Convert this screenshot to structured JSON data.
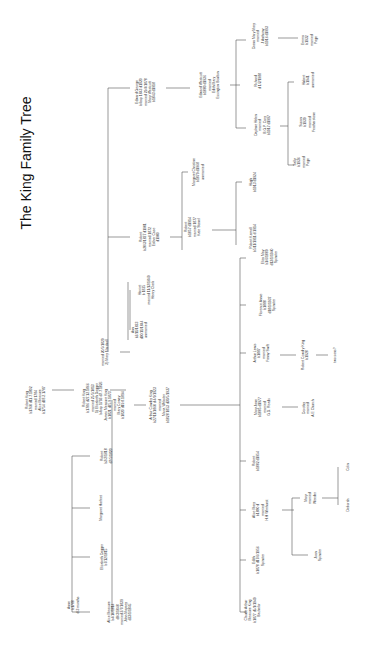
{
  "title": "The King Family Tree",
  "colors": {
    "background": "#ffffff",
    "line": "#555555",
    "text": "#333333"
  },
  "people": [
    {
      "id": "robert-king-sr",
      "x": 36,
      "y": 400,
      "lines": [
        "Robert King",
        "b1760 d11.7.1802",
        "married 1784",
        "Alice Measure",
        "b1754 d28.2.1787"
      ]
    },
    {
      "id": "robert-king",
      "x": 93,
      "y": 398,
      "lines": [
        "Robert King",
        "b1786 d27.12.1866",
        "married 25/5/1813",
        "1) Elizabeth Dagger",
        "b/bap 1793 d7.7.1826"
      ]
    },
    {
      "id": "robert-king-marriage2",
      "x": 105,
      "y": 352,
      "lines": [
        "married 20/5/1829",
        "2) Mary Marshall"
      ]
    },
    {
      "id": "anne",
      "x": 73,
      "y": 605,
      "lines": [
        "Anne",
        "b1788",
        "d 3 months"
      ]
    },
    {
      "id": "alice-measure",
      "x": 120,
      "y": 612,
      "lines": [
        "Alice Measure",
        "b4/10/1814",
        "d9/3/1848",
        "married 2/7/1839",
        "John Maysey",
        "d23/1/1845"
      ]
    },
    {
      "id": "elizabeth-dagger",
      "x": 104,
      "y": 557,
      "lines": [
        "Elizabeth Dagger",
        "b7/12/1815"
      ]
    },
    {
      "id": "margaret-harfeet",
      "x": 101,
      "y": 508,
      "lines": [
        "Margaret Harfeet"
      ]
    },
    {
      "id": "robert-b1818",
      "x": 106,
      "y": 456,
      "lines": [
        "Robert",
        "b2/2/1818",
        "d7/5/1820"
      ]
    },
    {
      "id": "james-measure-king",
      "x": 115,
      "y": 405,
      "lines": [
        "James Measure King",
        "b1821 d25.9.1873",
        "married",
        "Mary Cowey",
        "b1820 d19.8.1894"
      ]
    },
    {
      "id": "ann",
      "x": 140,
      "y": 330,
      "lines": [
        "Ann",
        "b2/11/1823",
        "d30/11/1844",
        "unmarried"
      ]
    },
    {
      "id": "harriet",
      "x": 147,
      "y": 290,
      "lines": [
        "Harriet",
        "b 1825",
        "married 11/12/1849",
        "Henry Clark"
      ]
    },
    {
      "id": "robert-b1827",
      "x": 150,
      "y": 237,
      "lines": [
        "Robert",
        "b20/3/1827 d1901",
        "married 1872",
        "Esther Case",
        "d1900"
      ]
    },
    {
      "id": "edward-george",
      "x": 146,
      "y": 92,
      "lines": [
        "Edward George",
        "b/bap 1843 d1920",
        "married 29/4/1878",
        "Mary Westcott",
        "b1843 d1918"
      ]
    },
    {
      "id": "arthur-cowdry-king",
      "x": 160,
      "y": 405,
      "lines": [
        "Arthur Cowdry King",
        "b27/11/1860 d 4/9/1923",
        "married",
        "Maria Webster",
        "b1828 1853 d30/5/1937"
      ]
    },
    {
      "id": "robert-b1857",
      "x": 193,
      "y": 227,
      "lines": [
        "Robert",
        "b1857 d1914",
        "married 1877",
        "Kate Stanel"
      ]
    },
    {
      "id": "margaret-christine",
      "x": 198,
      "y": 172,
      "lines": [
        "Margaret Christine",
        "b1879 d1968",
        "unmarried"
      ]
    },
    {
      "id": "edward-westcott",
      "x": 210,
      "y": 85,
      "lines": [
        "Edward Westcott",
        "b1880 d1936",
        "married",
        "Edith Mary",
        "Essington Boulton"
      ]
    },
    {
      "id": "robert-kemall",
      "x": 253,
      "y": 238,
      "lines": [
        "Robert Kemall",
        "b5/11/1911 d 1914"
      ]
    },
    {
      "id": "hugh",
      "x": 253,
      "y": 182,
      "lines": [
        "Hugh",
        "b1913 d1924"
      ]
    },
    {
      "id": "daphne-helen",
      "x": 263,
      "y": 125,
      "lines": [
        "Daphne Helen",
        "married",
        "B.G.P. Cary",
        "b1917 d1997"
      ]
    },
    {
      "id": "richard",
      "x": 258,
      "y": 81,
      "lines": [
        "Richard",
        "d 1/2/1988"
      ]
    },
    {
      "id": "diana-mary",
      "x": 261,
      "y": 36,
      "lines": [
        "Diana Mary Mary",
        "married",
        "J Anthony",
        "b1916 d1993"
      ]
    },
    {
      "id": "sally",
      "x": 302,
      "y": 162,
      "lines": [
        "Sally",
        "b1936",
        "married",
        "Page"
      ]
    },
    {
      "id": "susan",
      "x": 308,
      "y": 122,
      "lines": [
        "Susan",
        "b1939",
        "married",
        "Featherstone"
      ]
    },
    {
      "id": "hubert",
      "x": 308,
      "y": 80,
      "lines": [
        "Hubert",
        "b1941",
        "unmarried"
      ]
    },
    {
      "id": "emma",
      "x": 310,
      "y": 40,
      "lines": [
        "Emma",
        "b1932",
        "married",
        "Page"
      ]
    },
    {
      "id": "claude-arthur",
      "x": 253,
      "y": 610,
      "lines": [
        "Claude Arthur",
        "Measure King",
        "b1877 d5/1/1949",
        "Bachelor"
      ]
    },
    {
      "id": "edith",
      "x": 258,
      "y": 560,
      "lines": [
        "Edith",
        "b1878 d17/6/1956",
        "Spinster"
      ]
    },
    {
      "id": "alice-mary",
      "x": 261,
      "y": 510,
      "lines": [
        "Alice Mary",
        "b1880 d",
        "married",
        "H.H Wimhurst"
      ]
    },
    {
      "id": "robert-b1882",
      "x": 256,
      "y": 461,
      "lines": [
        "Robert",
        "b1882 d1954"
      ]
    },
    {
      "id": "mary-jane",
      "x": 263,
      "y": 407,
      "lines": [
        "Mary Jane",
        "b1885 d1977",
        "married",
        "G.D. Reads"
      ]
    },
    {
      "id": "arthur-lewis",
      "x": 262,
      "y": 353,
      "lines": [
        "Arthur Lewis",
        "b1887",
        "married",
        "Fanny Swift"
      ]
    },
    {
      "id": "florence-annie",
      "x": 268,
      "y": 305,
      "lines": [
        "Florence Annie",
        "b1888",
        "d18/1/1937",
        "Spinster"
      ]
    },
    {
      "id": "eliza-may",
      "x": 270,
      "y": 257,
      "lines": [
        "Eliza May",
        "b1/6/1889",
        "d13/1/1940",
        "Spinster"
      ]
    },
    {
      "id": "joan-spinster",
      "x": 318,
      "y": 555,
      "lines": [
        "Joan",
        "Spinster"
      ]
    },
    {
      "id": "mary-weeder",
      "x": 310,
      "y": 498,
      "lines": [
        "Mary",
        "married",
        "Weeder"
      ]
    },
    {
      "id": "dorothy",
      "x": 308,
      "y": 408,
      "lines": [
        "Dorothy",
        "married",
        "A.E Church"
      ]
    },
    {
      "id": "robert-cowdry-king",
      "x": 305,
      "y": 355,
      "lines": [
        "Robert Cowdry King",
        "b1928"
      ]
    },
    {
      "id": "two-sons",
      "x": 335,
      "y": 355,
      "lines": [
        "two sons?"
      ]
    },
    {
      "id": "deborah",
      "x": 348,
      "y": 505,
      "lines": [
        "Deborah"
      ]
    },
    {
      "id": "colin",
      "x": 348,
      "y": 467,
      "lines": [
        "Colin"
      ]
    }
  ]
}
